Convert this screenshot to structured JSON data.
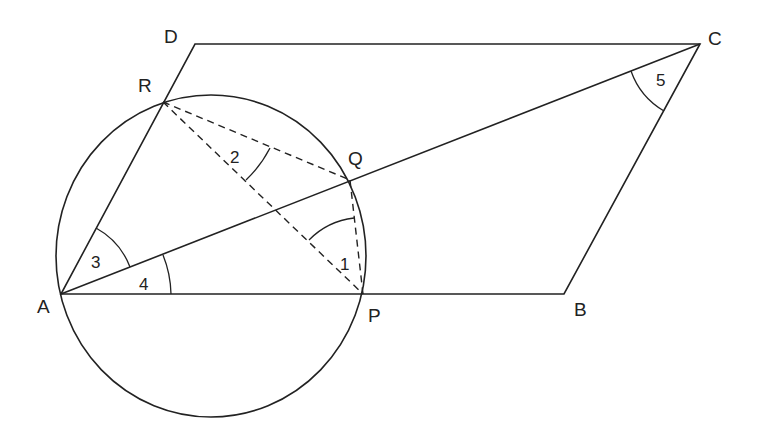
{
  "diagram": {
    "type": "geometry",
    "points": {
      "A": {
        "label": "A",
        "x": 61,
        "y": 294
      },
      "B": {
        "label": "B",
        "x": 564,
        "y": 294
      },
      "C": {
        "label": "C",
        "x": 700,
        "y": 44
      },
      "D": {
        "label": "D",
        "x": 195,
        "y": 44
      },
      "P": {
        "label": "P",
        "x": 363,
        "y": 294
      },
      "Q": {
        "label": "Q",
        "x": 350,
        "y": 180
      },
      "R": {
        "label": "R",
        "x": 163,
        "y": 102
      }
    },
    "angles": [
      {
        "label": "1",
        "at": "P",
        "between": [
          "PR",
          "PQ"
        ]
      },
      {
        "label": "2",
        "at": "R",
        "between": [
          "RQ",
          "RP"
        ]
      },
      {
        "label": "3",
        "at": "A",
        "between": [
          "AR",
          "AC"
        ]
      },
      {
        "label": "4",
        "at": "A",
        "between": [
          "AC",
          "AB"
        ]
      },
      {
        "label": "5",
        "at": "C",
        "between": [
          "CA",
          "CB"
        ]
      }
    ],
    "segments_solid": [
      "AB",
      "BC",
      "CD",
      "DA",
      "AC",
      "AP"
    ],
    "segments_dashed": [
      "RQ",
      "RP",
      "QP"
    ],
    "circle": {
      "through": [
        "A",
        "P",
        "Q",
        "R"
      ]
    },
    "colors": {
      "stroke": "#222222",
      "background": "#ffffff"
    }
  }
}
